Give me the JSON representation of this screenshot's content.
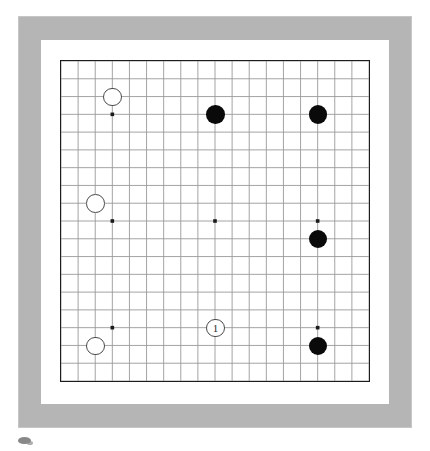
{
  "diagram": {
    "kind": "go-board-diagram",
    "board_size": 19,
    "frame_color": "#b5b5b5",
    "mat_color": "#ffffff",
    "board_color": "#ffffff",
    "board_border_color": "#1c1c1c",
    "grid_line_color": "#9a9a9a",
    "star_point_color": "#1a1a1a",
    "black_stone_color": "#0a0a0a",
    "white_stone_color": "#ffffff",
    "white_stone_border_color": "#4a4a4a"
  },
  "chart_data": {
    "type": "scatter",
    "xlabel": "",
    "ylabel": "",
    "board_size": 19,
    "grid": true,
    "legend": "none",
    "xlim": [
      0,
      18
    ],
    "ylim": [
      0,
      18
    ],
    "star_points": [
      {
        "col": 3,
        "row": 3
      },
      {
        "col": 9,
        "row": 3
      },
      {
        "col": 15,
        "row": 3
      },
      {
        "col": 3,
        "row": 9
      },
      {
        "col": 9,
        "row": 9
      },
      {
        "col": 15,
        "row": 9
      },
      {
        "col": 3,
        "row": 15
      },
      {
        "col": 9,
        "row": 15
      },
      {
        "col": 15,
        "row": 15
      }
    ],
    "series": [
      {
        "name": "Black",
        "color": "#0a0a0a",
        "values": [
          {
            "col": 9,
            "row": 3,
            "label": ""
          },
          {
            "col": 15,
            "row": 3,
            "label": ""
          },
          {
            "col": 15,
            "row": 10,
            "label": ""
          },
          {
            "col": 15,
            "row": 16,
            "label": ""
          }
        ]
      },
      {
        "name": "White",
        "color": "#ffffff",
        "values": [
          {
            "col": 3,
            "row": 2,
            "label": ""
          },
          {
            "col": 2,
            "row": 8,
            "label": ""
          },
          {
            "col": 2,
            "row": 16,
            "label": ""
          },
          {
            "col": 9,
            "row": 15,
            "label": "1"
          }
        ]
      }
    ]
  },
  "stones": {
    "black": [
      {
        "name": "black-stone-top-center",
        "col": 9,
        "row": 3,
        "label": ""
      },
      {
        "name": "black-stone-top-right",
        "col": 15,
        "row": 3,
        "label": ""
      },
      {
        "name": "black-stone-right",
        "col": 15,
        "row": 10,
        "label": ""
      },
      {
        "name": "black-stone-bottom-right",
        "col": 15,
        "row": 16,
        "label": ""
      }
    ],
    "white": [
      {
        "name": "white-stone-top-left",
        "col": 3,
        "row": 2,
        "label": ""
      },
      {
        "name": "white-stone-left",
        "col": 2,
        "row": 8,
        "label": ""
      },
      {
        "name": "white-stone-bottom-left",
        "col": 2,
        "row": 16,
        "label": ""
      },
      {
        "name": "white-stone-move-1",
        "col": 9,
        "row": 15,
        "label": "1"
      }
    ]
  },
  "moves": {
    "marked": [
      {
        "number": "1",
        "color": "white",
        "col": 9,
        "row": 15
      }
    ]
  }
}
